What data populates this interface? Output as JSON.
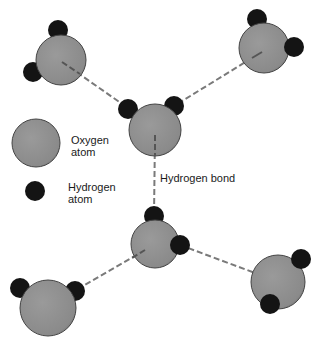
{
  "labels": {
    "oxygen_line1": "Oxygen",
    "oxygen_line2": "atom",
    "hydrogen_line1": "Hydrogen",
    "hydrogen_line2": "atom",
    "bond": "Hydrogen bond"
  },
  "colors": {
    "oxygen": "#8e8e8e",
    "oxygen_shadow": "#6f6f6f",
    "hydrogen": "#141414",
    "bond": "#7a7a7a"
  }
}
